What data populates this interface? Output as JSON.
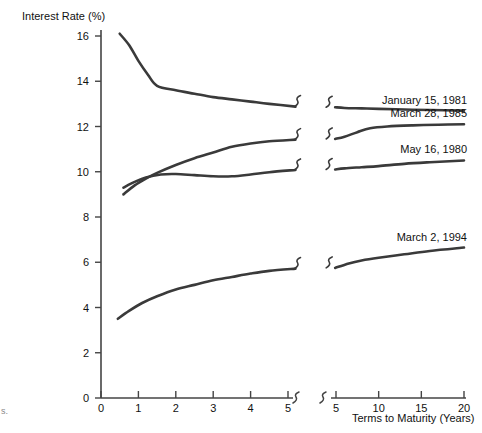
{
  "chart_data": {
    "type": "line",
    "title": "",
    "ylabel": "Interest Rate (%)",
    "xlabel": "Terms to Maturity (Years)",
    "ylim": [
      0,
      16.6
    ],
    "yticks": [
      0,
      2,
      4,
      6,
      8,
      10,
      12,
      14,
      16
    ],
    "ytick_labels": [
      "0",
      "2",
      "4",
      "6",
      "8",
      "10",
      "12",
      "14",
      "16"
    ],
    "grid": false,
    "legend_position": "right-inline",
    "axis_break": true,
    "x_segments": [
      {
        "name": "left",
        "range": [
          0,
          5.3
        ],
        "ticks": [
          0,
          1,
          2,
          3,
          4,
          5
        ],
        "tick_labels": [
          "0",
          "1",
          "2",
          "3",
          "4",
          "5"
        ]
      },
      {
        "name": "right",
        "range": [
          4.6,
          20.5
        ],
        "ticks": [
          5,
          10,
          15,
          20
        ],
        "tick_labels": [
          "5",
          "10",
          "15",
          "20"
        ]
      }
    ],
    "series": [
      {
        "name": "January 15, 1981",
        "label": "January 15, 1981",
        "left_points": [
          [
            0.5,
            16.1
          ],
          [
            0.75,
            15.6
          ],
          [
            1.0,
            14.9
          ],
          [
            1.25,
            14.3
          ],
          [
            1.5,
            13.8
          ],
          [
            2.0,
            13.6
          ],
          [
            2.5,
            13.45
          ],
          [
            3.0,
            13.3
          ],
          [
            3.5,
            13.2
          ],
          [
            4.0,
            13.1
          ],
          [
            4.5,
            13.0
          ],
          [
            5.2,
            12.88
          ]
        ],
        "right_points": [
          [
            4.9,
            12.85
          ],
          [
            6.0,
            12.82
          ],
          [
            8.0,
            12.8
          ],
          [
            10.0,
            12.78
          ],
          [
            13.0,
            12.75
          ],
          [
            16.0,
            12.73
          ],
          [
            20.0,
            12.7
          ]
        ]
      },
      {
        "name": "March 28, 1985",
        "label": "March 28, 1985",
        "left_points": [
          [
            0.6,
            9.0
          ],
          [
            0.9,
            9.4
          ],
          [
            1.2,
            9.7
          ],
          [
            1.5,
            9.95
          ],
          [
            2.0,
            10.3
          ],
          [
            2.5,
            10.6
          ],
          [
            3.0,
            10.85
          ],
          [
            3.5,
            11.1
          ],
          [
            4.0,
            11.25
          ],
          [
            4.5,
            11.35
          ],
          [
            5.2,
            11.42
          ]
        ],
        "right_points": [
          [
            4.9,
            11.45
          ],
          [
            6.0,
            11.55
          ],
          [
            7.5,
            11.75
          ],
          [
            9.0,
            11.92
          ],
          [
            11.0,
            12.0
          ],
          [
            14.0,
            12.05
          ],
          [
            17.0,
            12.08
          ],
          [
            20.0,
            12.1
          ]
        ]
      },
      {
        "name": "May 16, 1980",
        "label": "May 16, 1980",
        "left_points": [
          [
            0.6,
            9.3
          ],
          [
            0.9,
            9.55
          ],
          [
            1.2,
            9.75
          ],
          [
            1.6,
            9.88
          ],
          [
            2.0,
            9.9
          ],
          [
            2.5,
            9.85
          ],
          [
            3.0,
            9.8
          ],
          [
            3.5,
            9.8
          ],
          [
            4.0,
            9.88
          ],
          [
            4.5,
            9.98
          ],
          [
            5.2,
            10.08
          ]
        ],
        "right_points": [
          [
            4.9,
            10.1
          ],
          [
            6.0,
            10.15
          ],
          [
            8.0,
            10.2
          ],
          [
            10.0,
            10.25
          ],
          [
            13.0,
            10.35
          ],
          [
            16.0,
            10.42
          ],
          [
            20.0,
            10.5
          ]
        ]
      },
      {
        "name": "March 2, 1994",
        "label": "March 2, 1994",
        "left_points": [
          [
            0.45,
            3.5
          ],
          [
            0.75,
            3.85
          ],
          [
            1.1,
            4.2
          ],
          [
            1.5,
            4.5
          ],
          [
            2.0,
            4.8
          ],
          [
            2.5,
            5.0
          ],
          [
            3.0,
            5.2
          ],
          [
            3.5,
            5.35
          ],
          [
            4.0,
            5.5
          ],
          [
            4.5,
            5.62
          ],
          [
            5.2,
            5.72
          ]
        ],
        "right_points": [
          [
            4.9,
            5.75
          ],
          [
            6.5,
            5.95
          ],
          [
            8.0,
            6.08
          ],
          [
            10.0,
            6.2
          ],
          [
            13.0,
            6.35
          ],
          [
            16.0,
            6.5
          ],
          [
            20.0,
            6.65
          ]
        ]
      }
    ]
  },
  "labels": {
    "y_axis_title": "Interest Rate (%)",
    "x_axis_title": "Terms to Maturity (Years)",
    "series_1": "January 15, 1981",
    "series_2": "March 28, 1985",
    "series_3": "May 16, 1980",
    "series_4": "March 2, 1994",
    "corner_artifact": "s."
  },
  "yticks": {
    "t0": "0",
    "t1": "2",
    "t2": "4",
    "t3": "6",
    "t4": "8",
    "t5": "10",
    "t6": "12",
    "t7": "14",
    "t8": "16"
  },
  "xticks_left": {
    "t0": "0",
    "t1": "1",
    "t2": "2",
    "t3": "3",
    "t4": "4",
    "t5": "5"
  },
  "xticks_right": {
    "t0": "5",
    "t1": "10",
    "t2": "15",
    "t3": "20"
  },
  "colors": {
    "curve": "#3a3a3a",
    "axis": "#444444",
    "text": "#111111",
    "background": "#ffffff"
  }
}
